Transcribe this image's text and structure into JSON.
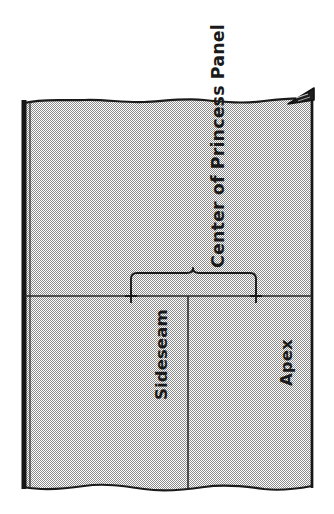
{
  "figure": {
    "orientation": "labels rotated 90 degrees counter-clockwise",
    "background_color": "#ffffff",
    "fabric_fill_color": "#c9c9c9",
    "line_color": "#1a1a1a",
    "labels": {
      "center_panel": "Center of Princess Panel",
      "sideseam": "Sideseam",
      "apex": "Apex"
    },
    "marks": {
      "bracket_name": "measurement-bracket",
      "bracket_from": "Sideseam",
      "bracket_to": "Apex",
      "tick_sideseam": "+",
      "tick_apex": "+",
      "corner_flap": "folded-corner-triangle"
    },
    "edges": {
      "top": "torn / raw wavy edge",
      "bottom": "torn / raw wavy edge",
      "left": "selvage band",
      "right": "straight cut edge"
    }
  }
}
